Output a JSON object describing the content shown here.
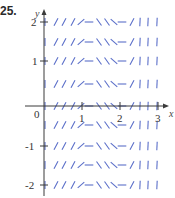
{
  "problem_label": "25.",
  "axes": {
    "x_label": "x",
    "y_label": "y",
    "origin_label": "0",
    "x_ticks": [
      "1",
      "2",
      "3"
    ],
    "y_ticks": [
      "2",
      "1",
      "-1",
      "-2"
    ]
  },
  "slope_field": {
    "description": "Slope field depending only on x; same pattern repeated in every row",
    "x_range": [
      0,
      3
    ],
    "y_range": [
      -2,
      2
    ],
    "rows_y": [
      2,
      1.5,
      1,
      0.5,
      0,
      -0.5,
      -1,
      -1.5,
      -2
    ],
    "column_pattern": [
      "/",
      "/",
      "/",
      "/",
      "—",
      "\\",
      "\\",
      "\\",
      "—",
      "/",
      "|",
      "|",
      "|"
    ],
    "segment_color": "#5b6fc9"
  },
  "colors": {
    "axis": "#3a3a3a",
    "segments": "#5b6fc9",
    "text": "#333333"
  }
}
